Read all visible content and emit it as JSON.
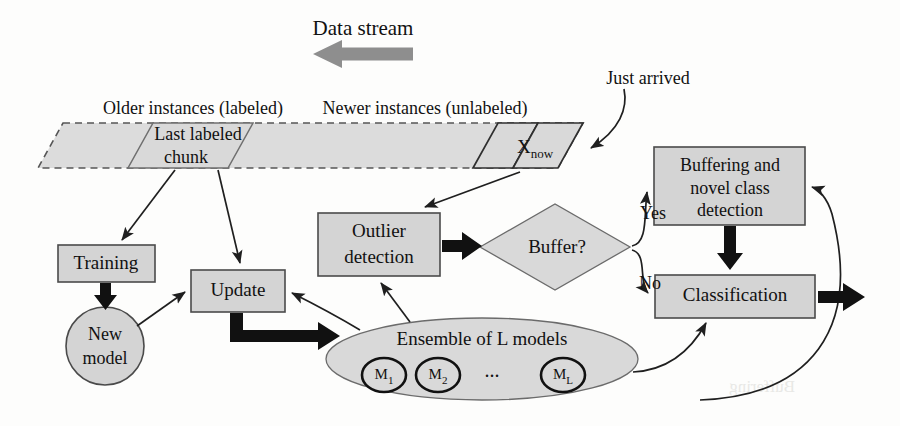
{
  "diagram": {
    "colors": {
      "shape_fill": "#d4d4d4",
      "band_fill": "#dcdcdc",
      "stroke": "#1f1f1f",
      "gray_arrow": "#8e8e8e",
      "background": "#fdfdfc"
    },
    "stream": {
      "direction_label": "Data stream",
      "older_label": "Older instances (labeled)",
      "newer_label": "Newer instances (unlabeled)",
      "chunk_label_line1": "Last labeled",
      "chunk_label_line2": "chunk",
      "current_instance_base": "X",
      "current_instance_sub": "now",
      "just_arrived_label": "Just arrived"
    },
    "nodes": {
      "training": "Training",
      "new_model_line1": "New",
      "new_model_line2": "model",
      "update": "Update",
      "outlier_line1": "Outlier",
      "outlier_line2": "detection",
      "buffer_decision": "Buffer?",
      "buffering_line1": "Buffering and",
      "buffering_line2": "novel class",
      "buffering_line3": "detection",
      "classification": "Classification",
      "ensemble": "Ensemble of L models"
    },
    "ensemble_models": [
      {
        "base": "M",
        "sub": "1"
      },
      {
        "base": "M",
        "sub": "2"
      },
      {
        "base": "M",
        "sub": "L"
      }
    ],
    "ensemble_ellipsis": "...",
    "branch_labels": {
      "yes": "Yes",
      "no": "No"
    }
  }
}
